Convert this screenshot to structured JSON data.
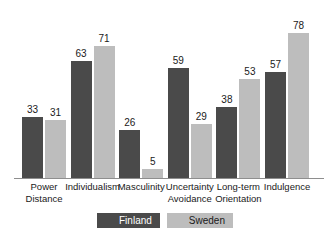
{
  "chart_data": {
    "type": "bar",
    "title": "",
    "subtitle": "",
    "xlabel": "",
    "ylabel": "",
    "ylim": [
      0,
      80
    ],
    "grid": false,
    "legend_position": "bottom",
    "categories": [
      "Power Distance",
      "Individualism",
      "Masculinity",
      "Uncertainty Avoidance",
      "Long-term Orientation",
      "Indulgence"
    ],
    "category_lines": [
      [
        "Power",
        "Distance"
      ],
      [
        "Individualism"
      ],
      [
        "Masculinity"
      ],
      [
        "Uncertainty",
        "Avoidance"
      ],
      [
        "Long-term",
        "Orientation"
      ],
      [
        "Indulgence"
      ]
    ],
    "series": [
      {
        "name": "Finland",
        "color": "#4a4a4a",
        "values": [
          33,
          63,
          26,
          59,
          38,
          57
        ]
      },
      {
        "name": "Sweden",
        "color": "#bdbdbd",
        "values": [
          31,
          71,
          5,
          29,
          53,
          78
        ]
      }
    ]
  },
  "legend": {
    "items": [
      {
        "label": "Finland",
        "color": "#4a4a4a"
      },
      {
        "label": "Sweden",
        "color": "#bdbdbd"
      }
    ]
  },
  "colors": {
    "finland": "#4a4a4a",
    "sweden": "#bdbdbd",
    "axis": "#8e8e8e",
    "text": "#1a1a1a",
    "background": "#ffffff"
  }
}
